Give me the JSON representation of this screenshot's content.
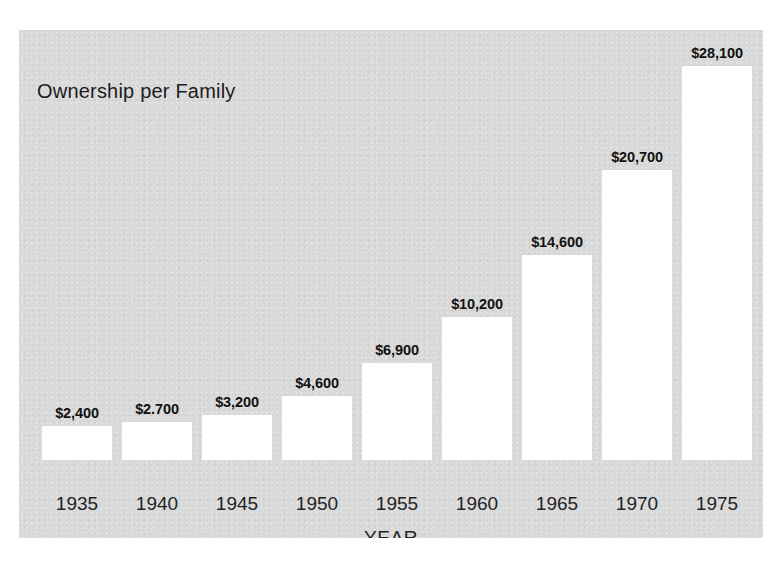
{
  "chart_data": {
    "type": "bar",
    "title": "Ownership per Family",
    "xlabel": "YEAR",
    "ylabel": "",
    "categories": [
      "1935",
      "1940",
      "1945",
      "1950",
      "1955",
      "1960",
      "1965",
      "1970",
      "1975"
    ],
    "values": [
      2400,
      2700,
      3200,
      4600,
      6900,
      10200,
      14600,
      20700,
      28100
    ],
    "value_labels": [
      "$2,400",
      "$2.700",
      "$3,200",
      "$4,600",
      "$6,900",
      "$10,200",
      "$14,600",
      "$20,700",
      "$28,100"
    ],
    "ylim": [
      0,
      28100
    ],
    "grid": false,
    "legend": null,
    "bar_color": "#ffffff",
    "panel_color": "#d9d9d9",
    "text_color": "#1c1c1c"
  },
  "figure": {
    "background": "#ffffff"
  }
}
